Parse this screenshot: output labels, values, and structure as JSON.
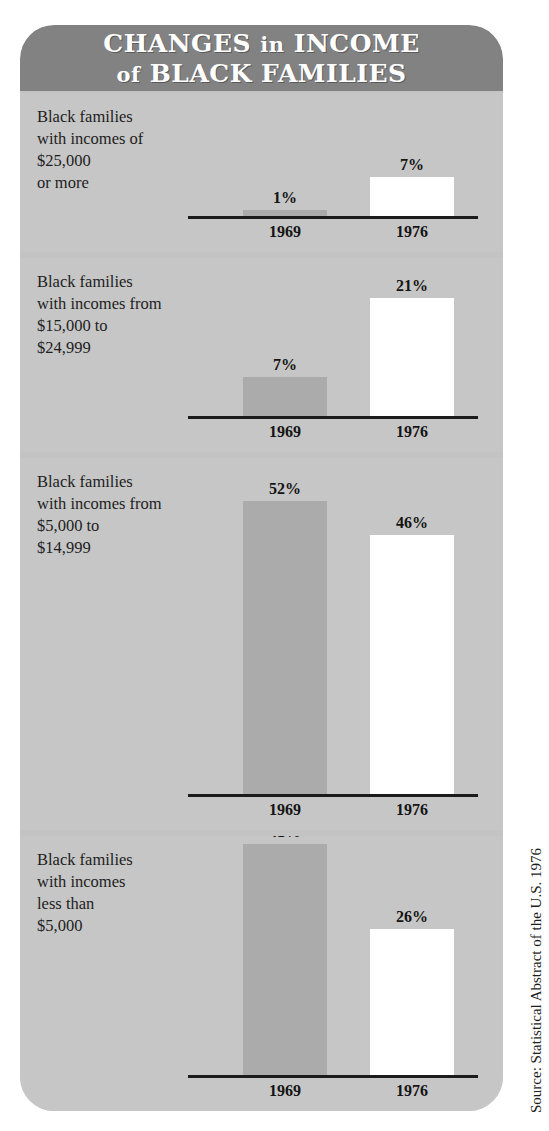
{
  "title": {
    "line1_main": "CHANGES",
    "line1_small": "in",
    "line1_tail": "INCOME",
    "line2_small": "of",
    "line2_tail": "BLACK FAMILIES",
    "full": "CHANGES in INCOME of BLACK FAMILIES"
  },
  "source": "Source: Statistical Abstract of the U.S. 1976",
  "colors": {
    "banner": "#828282",
    "card_background": "#c3c3c3",
    "panel_background": "#c6c6c6",
    "bar_1969": "#ababab",
    "bar_1976": "#ffffff",
    "baseline": "#1b1b1b",
    "text": "#1d1d1d"
  },
  "chart_data": {
    "type": "bar",
    "title": "CHANGES in INCOME of BLACK FAMILIES",
    "subtitle": "",
    "xlabel": "",
    "ylabel": "Percent of black families",
    "categories": [
      "1969",
      "1976"
    ],
    "ylim": [
      0,
      52
    ],
    "grid": false,
    "legend": "none",
    "value_suffix": "%",
    "source": "Source: Statistical Abstract of the U.S. 1976",
    "panels": [
      {
        "label_lines": [
          "Black families",
          "with incomes of",
          "$25,000",
          "or more"
        ],
        "label": "Black families with incomes of $25,000 or more",
        "bars": [
          {
            "year": "1969",
            "value": 1,
            "value_label": "1%",
            "color": "#ababab"
          },
          {
            "year": "1976",
            "value": 7,
            "value_label": "7%",
            "color": "#ffffff"
          }
        ]
      },
      {
        "label_lines": [
          "Black families",
          "with incomes from",
          "$15,000 to",
          "$24,999"
        ],
        "label": "Black families with incomes from $15,000 to $24,999",
        "bars": [
          {
            "year": "1969",
            "value": 7,
            "value_label": "7%",
            "color": "#ababab"
          },
          {
            "year": "1976",
            "value": 21,
            "value_label": "21%",
            "color": "#ffffff"
          }
        ]
      },
      {
        "label_lines": [
          "Black families",
          "with incomes from",
          "$5,000 to",
          "$14,999"
        ],
        "label": "Black families with incomes from $5,000 to $14,999",
        "bars": [
          {
            "year": "1969",
            "value": 52,
            "value_label": "52%",
            "color": "#ababab"
          },
          {
            "year": "1976",
            "value": 46,
            "value_label": "46%",
            "color": "#ffffff"
          }
        ]
      },
      {
        "label_lines": [
          "Black families",
          "with incomes",
          "less than",
          "$5,000"
        ],
        "label": "Black families with incomes less than $5,000",
        "bars": [
          {
            "year": "1969",
            "value": 41,
            "value_label": "41%",
            "color": "#ababab"
          },
          {
            "year": "1976",
            "value": 26,
            "value_label": "26%",
            "color": "#ffffff"
          }
        ]
      }
    ]
  }
}
